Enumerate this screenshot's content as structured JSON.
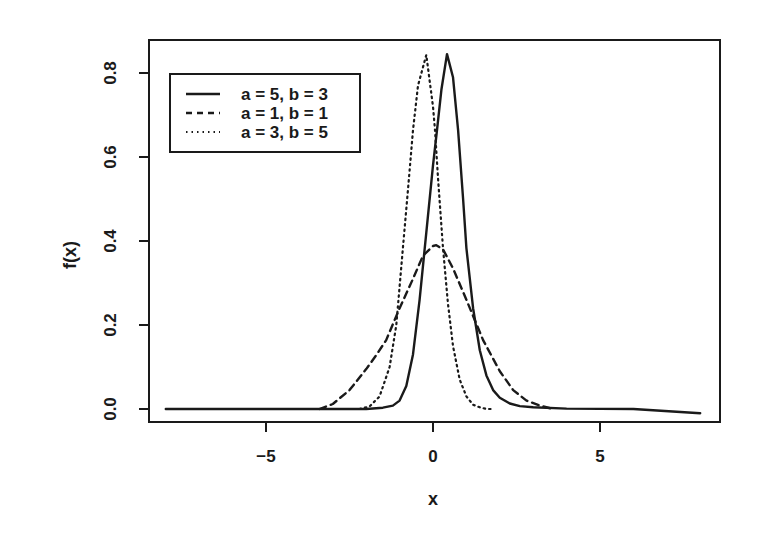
{
  "chart_data": {
    "type": "line",
    "title": "",
    "xlabel": "x",
    "ylabel": "f(x)",
    "xlim": [
      -8.5,
      8.6
    ],
    "ylim": [
      -0.03,
      0.88
    ],
    "grid": false,
    "legend_position": "top-left (inside)",
    "x_ticks": [
      -5,
      0,
      5
    ],
    "x_tick_labels": [
      "−5",
      "0",
      "5"
    ],
    "y_ticks": [
      0.0,
      0.2,
      0.4,
      0.6,
      0.8
    ],
    "y_tick_labels": [
      "0.0",
      "0.2",
      "0.4",
      "0.6",
      "0.8"
    ],
    "series": [
      {
        "name": "a = 5, b = 3",
        "style": "solid",
        "x": [
          -8,
          -3,
          -2,
          -1.5,
          -1.2,
          -1.0,
          -0.8,
          -0.6,
          -0.4,
          -0.2,
          0.0,
          0.12,
          0.25,
          0.42,
          0.6,
          0.75,
          0.9,
          1.0,
          1.2,
          1.4,
          1.6,
          1.8,
          2.0,
          2.3,
          2.6,
          3.0,
          4.0,
          6.0,
          8.0
        ],
        "y": [
          0.0,
          0.0,
          0.0,
          0.003,
          0.008,
          0.02,
          0.055,
          0.13,
          0.26,
          0.42,
          0.58,
          0.664,
          0.76,
          0.845,
          0.79,
          0.664,
          0.5,
          0.383,
          0.24,
          0.14,
          0.08,
          0.045,
          0.027,
          0.013,
          0.007,
          0.004,
          0.001,
          0.0,
          -0.01
        ]
      },
      {
        "name": "a = 1, b = 1",
        "style": "dashed",
        "x": [
          -3.4,
          -3.0,
          -2.5,
          -2.0,
          -1.7,
          -1.4,
          -1.0,
          -0.6,
          -0.3,
          0.0,
          0.1,
          0.3,
          0.6,
          1.0,
          1.5,
          2.0,
          2.4,
          2.8,
          3.2,
          3.6
        ],
        "y": [
          0.0,
          0.012,
          0.045,
          0.095,
          0.128,
          0.164,
          0.24,
          0.31,
          0.365,
          0.388,
          0.39,
          0.38,
          0.335,
          0.26,
          0.164,
          0.09,
          0.045,
          0.02,
          0.008,
          0.0
        ]
      },
      {
        "name": "a = 3, b = 5",
        "style": "dotted",
        "x": [
          -2.2,
          -1.9,
          -1.6,
          -1.3,
          -1.1,
          -0.9,
          -0.75,
          -0.6,
          -0.45,
          -0.2,
          0.0,
          0.06,
          0.15,
          0.3,
          0.45,
          0.6,
          0.8,
          1.0,
          1.2,
          1.4,
          1.6,
          1.8
        ],
        "y": [
          0.0,
          0.006,
          0.03,
          0.1,
          0.2,
          0.383,
          0.52,
          0.664,
          0.77,
          0.843,
          0.72,
          0.664,
          0.55,
          0.383,
          0.25,
          0.15,
          0.07,
          0.03,
          0.01,
          0.004,
          0.0,
          0.0
        ]
      }
    ]
  },
  "legend": {
    "items": [
      {
        "label": "a = 5, b = 3",
        "style": "solid"
      },
      {
        "label": "a = 1, b = 1",
        "style": "dashed"
      },
      {
        "label": "a = 3, b = 5",
        "style": "dotted"
      }
    ]
  },
  "axes": {
    "xlabel": "x",
    "ylabel": "f(x)"
  },
  "colors": {
    "ink": "#1a1a1a",
    "background": "#ffffff"
  }
}
